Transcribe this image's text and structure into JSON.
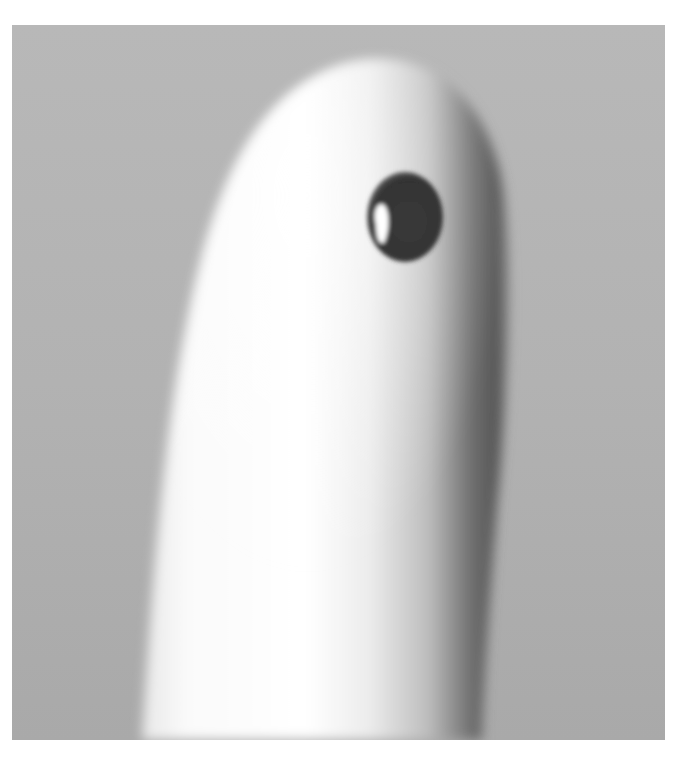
{
  "image": {
    "description": "Grayscale close-up photograph of an upright fingertip with a single dark droplet on the pad",
    "subject": "fingertip",
    "feature": "dark droplet",
    "colors": {
      "page_background": "#ffffff",
      "backdrop": "#b3b3b3",
      "skin_highlight": "#ffffff",
      "skin_shadow": "#5a5a5a",
      "droplet": "#3a3a3a",
      "droplet_highlight": "#ffffff"
    }
  }
}
